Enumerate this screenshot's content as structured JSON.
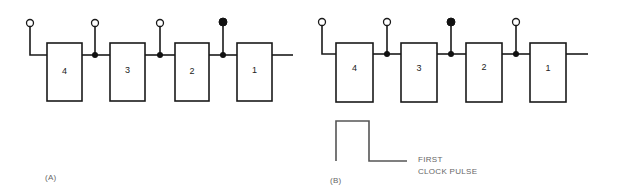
{
  "figure_a": {
    "label": "(A)",
    "boxes": [
      {
        "label": "4",
        "x": 47,
        "w": 35
      },
      {
        "label": "3",
        "x": 110,
        "w": 35
      },
      {
        "label": "2",
        "x": 175,
        "w": 34
      },
      {
        "label": "1",
        "x": 237,
        "w": 35
      }
    ],
    "outputs": [
      {
        "x": 30,
        "state": "open",
        "junction": false
      },
      {
        "x": 95,
        "state": "open",
        "junction": true
      },
      {
        "x": 160,
        "state": "open",
        "junction": true
      },
      {
        "x": 223,
        "state": "filled",
        "junction": true
      }
    ],
    "wire_end": 293
  },
  "figure_b": {
    "label": "(B)",
    "boxes": [
      {
        "label": "4",
        "x": 336,
        "w": 37
      },
      {
        "label": "3",
        "x": 401,
        "w": 36
      },
      {
        "label": "2",
        "x": 466,
        "w": 36
      },
      {
        "label": "1",
        "x": 530,
        "w": 36
      }
    ],
    "outputs": [
      {
        "x": 322,
        "state": "open",
        "junction": false
      },
      {
        "x": 387,
        "state": "open",
        "junction": true
      },
      {
        "x": 451,
        "state": "filled",
        "junction": true
      },
      {
        "x": 516,
        "state": "open",
        "junction": true
      }
    ],
    "wire_end": 588,
    "pulse_caption": {
      "line1": "FIRST",
      "line2": "CLOCK PULSE"
    }
  },
  "colors": {
    "line": "#1a1a1a",
    "pulse": "#555555",
    "caption": "#666666"
  }
}
